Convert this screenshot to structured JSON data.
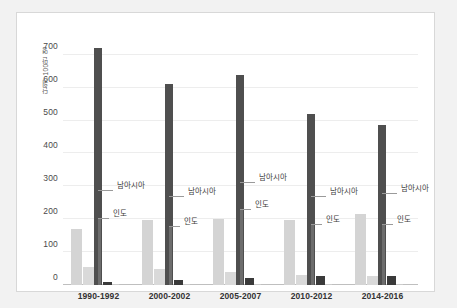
{
  "chart_data": {
    "type": "bar",
    "title": "",
    "subtitle": "",
    "xlabel": "",
    "ylabel": "단위: 100만 명",
    "ylim": [
      0,
      760
    ],
    "grid": true,
    "legend_position": "none",
    "annotations_inline": true,
    "categories": [
      "1990-1992",
      "2000-2002",
      "2005-2007",
      "2010-2012",
      "2014-2016"
    ],
    "yticks": [
      "0",
      "100",
      "200",
      "300",
      "400",
      "500",
      "600",
      "700"
    ],
    "ytick_values": [
      0,
      100,
      200,
      300,
      400,
      500,
      600,
      700
    ],
    "series": [
      {
        "name": "bar-1",
        "color": "#d4d4d4",
        "values": [
          170,
          197,
          201,
          199,
          215
        ]
      },
      {
        "name": "bar-2",
        "color": "#d9d9d9",
        "values": [
          55,
          50,
          39,
          30,
          27
        ]
      },
      {
        "name": "남아시아",
        "color": "#4f4f4f",
        "values": [
          720,
          611,
          639,
          519,
          487
        ]
      },
      {
        "name": "인도",
        "color": "#4a4a4a",
        "values": [
          205,
          180,
          231,
          185,
          184
        ]
      },
      {
        "name": "bar-5",
        "color": "#3a3a3a",
        "values": [
          9,
          16,
          20,
          27,
          27
        ]
      },
      {
        "name": "bar-6",
        "color": "#c9c9c9",
        "values": [
          2,
          4,
          2,
          3,
          3
        ]
      }
    ],
    "annotations": [
      {
        "label": "남아시아",
        "value": 288,
        "group": 0
      },
      {
        "label": "인도",
        "value": 205,
        "group": 0
      },
      {
        "label": "남아시아",
        "value": 271,
        "group": 1
      },
      {
        "label": "인도",
        "value": 180,
        "group": 1
      },
      {
        "label": "남아시아",
        "value": 314,
        "group": 2
      },
      {
        "label": "인도",
        "value": 231,
        "group": 2
      },
      {
        "label": "남아시아",
        "value": 272,
        "group": 3
      },
      {
        "label": "인도",
        "value": 185,
        "group": 3
      },
      {
        "label": "남아시아",
        "value": 280,
        "group": 4
      },
      {
        "label": "인도",
        "value": 184,
        "group": 4
      }
    ]
  },
  "colors": {
    "page_background": "#f2f2f2",
    "panel_background": "#ffffff",
    "panel_border": "#d8d8d8",
    "gridline": "#ededed",
    "axis": "#bfbfbf",
    "light_bar": "#d4d4d4",
    "dark_bar": "#4f4f4f",
    "leader_line": "#9a9a9a",
    "tick_text": "#4a4a4a",
    "category_text": "#333333"
  }
}
